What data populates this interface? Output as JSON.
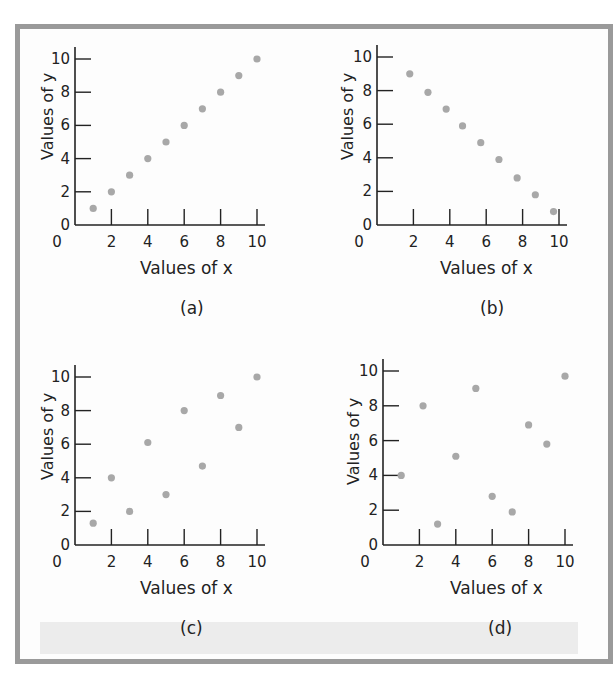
{
  "figure": {
    "panels": [
      {
        "id": "a",
        "label": "(a)",
        "xlabel": "Values of x",
        "ylabel": "Values of y"
      },
      {
        "id": "b",
        "label": "(b)",
        "xlabel": "Values of x",
        "ylabel": "Values of y"
      },
      {
        "id": "c",
        "label": "(c)",
        "xlabel": "Values of x",
        "ylabel": "Values of y"
      },
      {
        "id": "d",
        "label": "(d)",
        "xlabel": "Values of x",
        "ylabel": "Values of y"
      }
    ],
    "colors": {
      "points": "#a8a8a8",
      "axis": "#222222",
      "border": "#9a9a9a"
    }
  },
  "chart_data": [
    {
      "type": "scatter",
      "title": "(a)",
      "xlabel": "Values of x",
      "ylabel": "Values of y",
      "xlim": [
        0,
        10
      ],
      "ylim": [
        0,
        10
      ],
      "xticks": [
        0,
        2,
        4,
        6,
        8,
        10
      ],
      "yticks": [
        0,
        2,
        4,
        6,
        8,
        10
      ],
      "grid": false,
      "x": [
        1,
        2,
        3,
        4,
        5,
        6,
        7,
        8,
        9,
        10
      ],
      "y": [
        1,
        2,
        3,
        4,
        5,
        6,
        7,
        8,
        9,
        10
      ]
    },
    {
      "type": "scatter",
      "title": "(b)",
      "xlabel": "Values of x",
      "ylabel": "Values of y",
      "xlim": [
        0,
        10
      ],
      "ylim": [
        0,
        10
      ],
      "xticks": [
        0,
        2,
        4,
        6,
        8,
        10
      ],
      "yticks": [
        0,
        2,
        4,
        6,
        8,
        10
      ],
      "grid": false,
      "x": [
        1.8,
        2.8,
        3.8,
        4.7,
        5.7,
        6.7,
        7.7,
        8.7,
        9.7
      ],
      "y": [
        9,
        7.9,
        6.9,
        5.9,
        4.9,
        3.9,
        2.8,
        1.8,
        0.8
      ]
    },
    {
      "type": "scatter",
      "title": "(c)",
      "xlabel": "Values of x",
      "ylabel": "Values of y",
      "xlim": [
        0,
        10
      ],
      "ylim": [
        0,
        10
      ],
      "xticks": [
        0,
        2,
        4,
        6,
        8,
        10
      ],
      "yticks": [
        0,
        2,
        4,
        6,
        8,
        10
      ],
      "grid": false,
      "x": [
        1,
        2,
        3,
        4,
        5,
        6,
        7,
        8,
        9,
        10
      ],
      "y": [
        1.3,
        4,
        2,
        6.1,
        3,
        8,
        4.7,
        8.9,
        7,
        10
      ]
    },
    {
      "type": "scatter",
      "title": "(d)",
      "xlabel": "Values of x",
      "ylabel": "Values of y",
      "xlim": [
        0,
        10
      ],
      "ylim": [
        0,
        10
      ],
      "xticks": [
        0,
        2,
        4,
        6,
        8,
        10
      ],
      "yticks": [
        0,
        2,
        4,
        6,
        8,
        10
      ],
      "grid": false,
      "x": [
        1,
        2.2,
        3,
        4,
        5.1,
        6,
        7.1,
        8,
        9,
        10
      ],
      "y": [
        4,
        8,
        1.2,
        5.1,
        9,
        2.8,
        1.9,
        6.9,
        5.8,
        9.7
      ]
    }
  ]
}
